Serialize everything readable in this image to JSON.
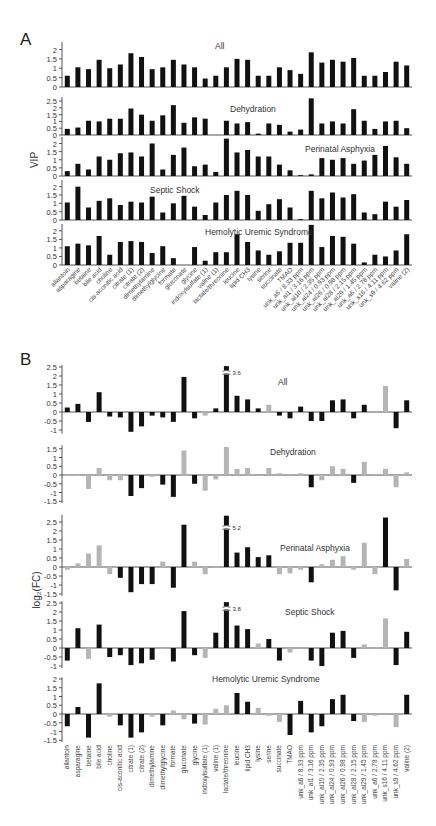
{
  "chart_data": [
    {
      "panel": "A",
      "type": "bar",
      "ylabel": "VIP",
      "categories": [
        "allantoin",
        "asparagine",
        "betaine",
        "bile acid",
        "choline",
        "cis-aconitic acid",
        "citrate (1)",
        "citrate (2)",
        "dimethylamine",
        "dimethylglycine",
        "formate",
        "gluconate",
        "glycine",
        "indoxylsulfate (1)",
        "valine (1)",
        "lactate/threonine",
        "leucine",
        "lipid CH3",
        "lysine",
        "serine",
        "succinate",
        "TMAO",
        "unk_a6 / 8.33 ppm",
        "unk_al1 / 3.16 ppm",
        "unk_al10 / 2.35 ppm",
        "unk_al24 / 0.93 ppm",
        "unk_al26 / 0.98 ppm",
        "unk_al28 / 2.15 ppm",
        "unk_al29 / 1.45 ppm",
        "unk_a6 / 2.78 ppm",
        "unk_s16 / 4.11 ppm",
        "unk_s9 / 4.62 ppm",
        "valine (2)"
      ],
      "series": [
        {
          "name": "All",
          "ylim": [
            0,
            2.5
          ],
          "ticks": [
            0,
            0.5,
            1,
            1.5,
            2
          ],
          "values": [
            0.6,
            1.05,
            0.95,
            1.45,
            1.0,
            1.2,
            1.8,
            1.6,
            0.95,
            1.05,
            1.45,
            1.2,
            1.05,
            0.45,
            0.6,
            1.05,
            1.5,
            1.45,
            0.6,
            0.6,
            1.05,
            0.9,
            0.7,
            1.85,
            1.3,
            1.45,
            1.35,
            1.55,
            0.6,
            0.6,
            0.8,
            1.35,
            1.15
          ]
        },
        {
          "name": "Dehydration",
          "ylim": [
            0,
            2.5
          ],
          "ticks": [
            0,
            0.5,
            1,
            1.5,
            2,
            2.5
          ],
          "values": [
            0.45,
            0.55,
            1.05,
            1.0,
            1.2,
            1.2,
            1.95,
            1.5,
            1.05,
            1.45,
            2.2,
            0.9,
            1.3,
            1.2,
            0.0,
            1.05,
            0.85,
            0.95,
            0.1,
            0.85,
            0.75,
            0.25,
            0.4,
            2.7,
            0.85,
            1.0,
            0.85,
            1.9,
            1.05,
            0.45,
            1.0,
            1.05,
            0.5
          ]
        },
        {
          "name": "Perinatal Asphyxia",
          "ylim": [
            0,
            2.5
          ],
          "ticks": [
            0,
            0.5,
            1,
            1.5,
            2
          ],
          "values": [
            0.3,
            0.75,
            0.4,
            1.2,
            1.0,
            1.4,
            1.45,
            1.2,
            2.0,
            0.4,
            1.3,
            1.75,
            0.6,
            0.7,
            0.25,
            2.3,
            1.45,
            1.6,
            1.2,
            1.2,
            0.7,
            0.35,
            0.05,
            0.1,
            1.1,
            1.0,
            1.1,
            0.75,
            0.95,
            1.3,
            1.85,
            1.15,
            0.75
          ]
        },
        {
          "name": "Septic Shock",
          "ylim": [
            0,
            2.5
          ],
          "ticks": [
            0,
            0.5,
            1,
            1.5,
            2
          ],
          "values": [
            1.05,
            2.0,
            0.75,
            1.15,
            1.3,
            0.9,
            1.1,
            1.05,
            1.4,
            0.45,
            1.0,
            1.45,
            0.8,
            0.3,
            1.05,
            1.5,
            1.75,
            1.5,
            0.55,
            0.95,
            1.25,
            0.75,
            0.05,
            1.75,
            1.3,
            1.65,
            1.35,
            1.55,
            0.45,
            0.35,
            1.1,
            0.8,
            1.2
          ]
        },
        {
          "name": "Hemolytic Uremic Syndrome",
          "ylim": [
            0,
            2.5
          ],
          "ticks": [
            0,
            0.5,
            1,
            1.5,
            2
          ],
          "values": [
            1.1,
            1.25,
            1.15,
            1.7,
            0.6,
            1.35,
            1.4,
            1.35,
            0.7,
            1.1,
            0.4,
            0.0,
            1.05,
            0.25,
            0.75,
            0.75,
            1.8,
            1.35,
            0.85,
            0.6,
            0.8,
            1.3,
            1.3,
            2.35,
            1.05,
            1.7,
            1.65,
            1.25,
            0.15,
            0.6,
            0.5,
            0.85,
            1.8
          ]
        }
      ]
    },
    {
      "panel": "B",
      "type": "bar",
      "ylabel": "log2(FC)",
      "categories": [
        "allantoin",
        "asparagine",
        "betaine",
        "bile acid",
        "choline",
        "cis-aconitic acid",
        "citrate (1)",
        "citrate (2)",
        "dimethylamine",
        "dimethylglycine",
        "formate",
        "gluconate",
        "glycine",
        "indoxylsulfate (1)",
        "valine (1)",
        "lactate/threonine",
        "leucine",
        "lipid CH3",
        "lysine",
        "serine",
        "succinate",
        "TMAO",
        "unk_a6 / 8.33 ppm",
        "unk_al1 / 3.16 ppm",
        "unk_al10 / 2.35 ppm",
        "unk_al24 / 0.93 ppm",
        "unk_al26 / 0.98 ppm",
        "unk_al28 / 2.15 ppm",
        "unk_al29 / 1.45 ppm",
        "unk_a6 / 2.78 ppm",
        "unk_s16 / 4.11 ppm",
        "unk_s9 / 4.62 ppm",
        "valine (2)"
      ],
      "bar_colors": {
        "significant": "#111111",
        "non_significant": "#b5b5b5"
      },
      "series": [
        {
          "name": "All",
          "ylim": [
            -1.2,
            2.6
          ],
          "ticks": [
            -1,
            -0.5,
            0,
            0.5,
            1,
            1.5,
            2,
            2.5
          ],
          "break": {
            "index": 15,
            "label": "3.6"
          },
          "values": [
            0.25,
            0.45,
            -0.55,
            1.1,
            -0.25,
            -0.3,
            -1.1,
            -0.8,
            -0.2,
            -0.3,
            -0.55,
            1.95,
            -0.35,
            -0.2,
            0.2,
            3.6,
            0.9,
            0.7,
            0.2,
            0.4,
            -0.2,
            -0.35,
            0.3,
            -0.5,
            -0.5,
            0.65,
            0.7,
            -0.35,
            0.4,
            -0.05,
            1.45,
            -0.9,
            0.65
          ],
          "significant": [
            1,
            1,
            1,
            1,
            1,
            1,
            1,
            1,
            1,
            1,
            1,
            1,
            1,
            0,
            1,
            1,
            1,
            1,
            1,
            0,
            1,
            1,
            1,
            1,
            1,
            1,
            1,
            1,
            1,
            0,
            0,
            1,
            1
          ]
        },
        {
          "name": "Dehydration",
          "ylim": [
            -1.6,
            1.7
          ],
          "ticks": [
            -1.5,
            -1,
            -0.5,
            0,
            0.5,
            1,
            1.5
          ],
          "values": [
            -0.05,
            -0.05,
            -0.8,
            0.4,
            -0.3,
            -0.3,
            -1.2,
            -0.75,
            -0.1,
            -0.55,
            -1.25,
            1.4,
            -0.5,
            -0.9,
            -0.25,
            1.6,
            0.35,
            0.4,
            0.0,
            0.4,
            0.1,
            0.05,
            0.1,
            -0.7,
            -0.3,
            0.5,
            0.35,
            -0.45,
            0.75,
            0.05,
            0.35,
            -0.7,
            0.15
          ],
          "significant": [
            0,
            0,
            0,
            0,
            0,
            0,
            1,
            1,
            0,
            1,
            1,
            0,
            1,
            0,
            0,
            0,
            0,
            0,
            0,
            0,
            0,
            0,
            0,
            1,
            0,
            0,
            0,
            1,
            0,
            0,
            0,
            0,
            0
          ]
        },
        {
          "name": "Perinatal Asphyxia",
          "ylim": [
            -1.6,
            2.9
          ],
          "ticks": [
            -1.5,
            -1,
            -0.5,
            0,
            0.5,
            1,
            1.5,
            2,
            2.5
          ],
          "break": {
            "index": 15,
            "label": "5.2"
          },
          "values": [
            -0.15,
            0.2,
            0.75,
            1.2,
            -0.4,
            -0.6,
            -1.4,
            -0.95,
            -0.95,
            0.3,
            -1.15,
            2.35,
            0.3,
            -0.4,
            -0.05,
            5.2,
            0.8,
            1.1,
            0.55,
            0.65,
            -0.4,
            -0.35,
            -0.15,
            -0.85,
            0.15,
            0.4,
            0.6,
            -0.15,
            1.35,
            -0.4,
            2.75,
            -1.3,
            0.45
          ],
          "significant": [
            0,
            0,
            0,
            0,
            0,
            1,
            1,
            1,
            1,
            0,
            1,
            1,
            0,
            0,
            0,
            1,
            1,
            1,
            1,
            1,
            0,
            0,
            0,
            1,
            0,
            0,
            0,
            0,
            0,
            0,
            1,
            1,
            0
          ]
        },
        {
          "name": "Septic Shock",
          "ylim": [
            -1.1,
            2.6
          ],
          "ticks": [
            -1,
            -0.5,
            0,
            0.5,
            1,
            1.5,
            2,
            2.5
          ],
          "break": {
            "index": 15,
            "label": "3.8"
          },
          "values": [
            -0.7,
            1.1,
            -0.6,
            1.3,
            -0.5,
            -0.4,
            -0.95,
            -0.85,
            -0.65,
            -0.05,
            -0.75,
            2.05,
            -0.4,
            -0.55,
            0.85,
            3.8,
            1.25,
            1.05,
            0.25,
            0.5,
            -0.7,
            -0.25,
            0.0,
            -0.7,
            -1.0,
            0.85,
            0.95,
            -0.55,
            0.2,
            -0.05,
            1.65,
            -0.95,
            0.9
          ],
          "significant": [
            1,
            1,
            0,
            1,
            1,
            1,
            1,
            1,
            1,
            0,
            1,
            1,
            1,
            0,
            1,
            1,
            1,
            1,
            0,
            1,
            1,
            0,
            0,
            1,
            1,
            1,
            1,
            1,
            0,
            0,
            0,
            1,
            1
          ]
        },
        {
          "name": "Hemolytic Uremic Syndrome",
          "ylim": [
            -1.6,
            2.1
          ],
          "ticks": [
            -1.5,
            -1,
            -0.5,
            0,
            0.5,
            1,
            1.5,
            2
          ],
          "values": [
            -0.7,
            0.4,
            -1.35,
            1.75,
            -0.15,
            -0.65,
            -1.35,
            -1.05,
            -0.15,
            -0.65,
            0.2,
            -0.3,
            -0.55,
            -0.6,
            0.3,
            0.5,
            1.2,
            0.7,
            0.35,
            -0.1,
            -0.45,
            -1.2,
            0.75,
            -1.05,
            -0.7,
            0.85,
            1.1,
            -0.4,
            -0.45,
            -0.1,
            -0.05,
            -0.75,
            1.1
          ],
          "significant": [
            1,
            1,
            1,
            1,
            0,
            1,
            1,
            1,
            0,
            1,
            0,
            0,
            1,
            0,
            0,
            0,
            1,
            1,
            0,
            0,
            0,
            1,
            1,
            1,
            1,
            1,
            1,
            1,
            0,
            0,
            0,
            0,
            1
          ]
        }
      ]
    }
  ],
  "panels": {
    "A": {
      "letter": "A",
      "ylabel": "VIP",
      "titles": [
        "All",
        "Dehydration",
        "Perinatal Asphyxia",
        "Septic Shock",
        "Hemolytic Uremic Syndrome"
      ]
    },
    "B": {
      "letter": "B",
      "ylabel": "log₂(FC)",
      "titles": [
        "All",
        "Dehydration",
        "Perinatal Asphyxia",
        "Septic Shock",
        "Hemolytic Uremic Syndrome"
      ]
    }
  }
}
